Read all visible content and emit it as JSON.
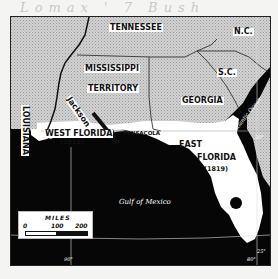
{
  "signature": "Lomax ' 7 Bush",
  "map": {
    "states": {
      "tennessee": "TENNESSEE",
      "north_carolina": "N.C.",
      "mississippi_territory_line1": "MISSISSIPPI",
      "mississippi_territory_line2": "TERRITORY",
      "south_carolina": "S.C.",
      "georgia": "GEORGIA",
      "louisiana": "LOUISIANA"
    },
    "regions": {
      "west_florida": "WEST FLORIDA",
      "west_florida_year": "(1812)",
      "east_florida_line1": "EAST",
      "east_florida_line2": "FLORIDA",
      "east_florida_year": "(1819)"
    },
    "places": {
      "pensacola": "PENSACOLA",
      "jackson": "Jackson"
    },
    "water": {
      "gulf": "Gulf of Mexico",
      "atlantic": "Atlantic Ocean"
    },
    "graticule": {
      "lat_30": "30°",
      "lat_25": "25°",
      "lon_90": "90°",
      "lon_80": "80°"
    },
    "scale": {
      "title": "MILES",
      "ticks": [
        "0",
        "100",
        "200"
      ]
    },
    "colors": {
      "water": "#060606",
      "land_us": "#c8c8c8",
      "florida": "#ffffff",
      "label_bg": "#ffffff"
    }
  }
}
